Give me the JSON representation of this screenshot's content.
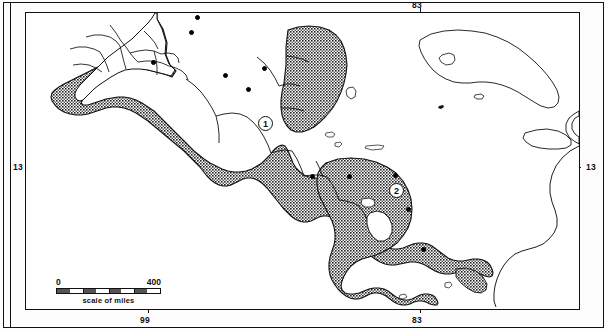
{
  "map": {
    "title": "Mesoamerica culture area map",
    "projection_note": "",
    "graticule_labels": {
      "top": [
        {
          "text": "83",
          "x": 420
        }
      ],
      "bottom": [
        {
          "text": "99",
          "x": 148
        },
        {
          "text": "83",
          "x": 420
        }
      ],
      "left": [
        {
          "text": "13",
          "y": 167
        }
      ],
      "right": [
        {
          "text": "13",
          "y": 167
        }
      ]
    },
    "scale": {
      "min_label": "0",
      "max_label": "400",
      "caption": "scale of miles",
      "units": "miles",
      "max_value": 400
    },
    "markers": [
      {
        "label": "1",
        "x": 258,
        "y": 122,
        "name": "region-marker-1"
      },
      {
        "label": "2",
        "x": 389,
        "y": 189,
        "name": "region-marker-2"
      }
    ],
    "city_dots": [
      {
        "x": 196,
        "y": 13
      },
      {
        "x": 190,
        "y": 28
      },
      {
        "x": 152,
        "y": 58
      },
      {
        "x": 263,
        "y": 64
      },
      {
        "x": 224,
        "y": 71
      },
      {
        "x": 247,
        "y": 85
      },
      {
        "x": 348,
        "y": 172
      },
      {
        "x": 311,
        "y": 172
      },
      {
        "x": 394,
        "y": 171
      },
      {
        "x": 407,
        "y": 205
      },
      {
        "x": 422,
        "y": 245
      }
    ],
    "colors": {
      "ink": "#111111",
      "shaded_fill": "#7a7a7a",
      "water": "#ffffff",
      "land_unshaded": "#ffffff"
    },
    "legend_note": ""
  }
}
